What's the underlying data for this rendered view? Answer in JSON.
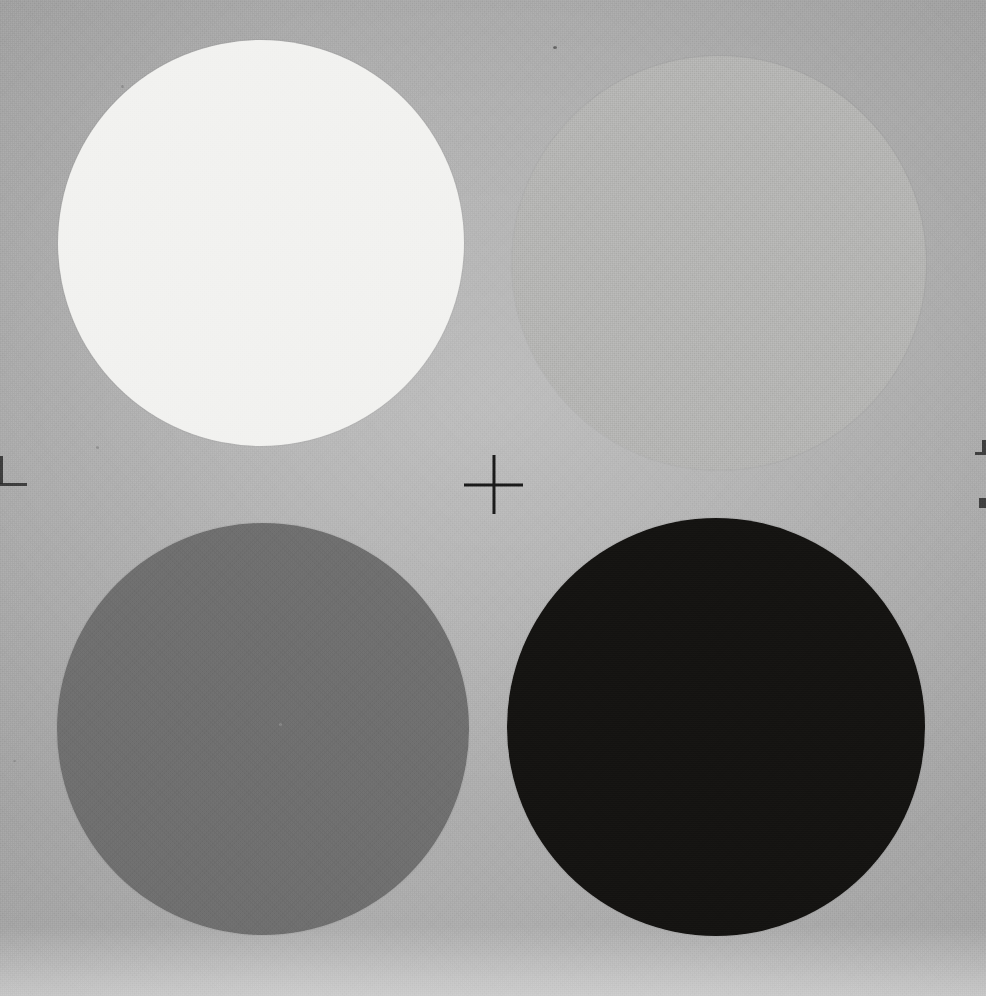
{
  "document": {
    "title": "Grayscale Calibration Target",
    "kind": "scanned-reflectance-target",
    "width_px": 986,
    "height_px": 996
  },
  "background": {
    "label": "paper substrate",
    "color": "#c9c9c9",
    "bottom_edge_color": "#fbfbfb"
  },
  "registration_mark": {
    "label": "center registration crosshair",
    "color": "#1a1a1a",
    "center_x": 493,
    "center_y": 484,
    "arm_length_px": 29,
    "stroke_px": 3
  },
  "chart_data": {
    "type": "scatter",
    "title": "Grayscale Calibration Target",
    "subtitle": "Four-step reflectance patch array with center registration mark",
    "xlabel": "",
    "ylabel": "",
    "xlim": [
      0,
      986
    ],
    "ylim": [
      0,
      996
    ],
    "grid": false,
    "legend": "none",
    "categories": [
      "White",
      "Light Gray",
      "Mid Gray",
      "Black"
    ],
    "values": [
      94,
      72,
      42,
      8
    ],
    "value_unit": "% reflectance",
    "series": [
      {
        "name": "Reflectance patches",
        "points": [
          {
            "id": "patch-white",
            "label": "White",
            "position": "top-left",
            "color": "#f2f2f0",
            "reflectance_percent": 94,
            "cx": 261,
            "cy": 243,
            "r": 203
          },
          {
            "id": "patch-light-gray",
            "label": "Light Gray",
            "position": "top-right",
            "color": "#b4b4b2",
            "reflectance_percent": 72,
            "cx": 719,
            "cy": 263,
            "r": 207
          },
          {
            "id": "patch-mid-gray",
            "label": "Mid Gray",
            "position": "bottom-left",
            "color": "#6e6e6e",
            "reflectance_percent": 42,
            "cx": 263,
            "cy": 729,
            "r": 206
          },
          {
            "id": "patch-black",
            "label": "Black",
            "position": "bottom-right",
            "color": "#141311",
            "reflectance_percent": 8,
            "cx": 716,
            "cy": 727,
            "r": 209
          }
        ]
      }
    ],
    "annotations": [
      {
        "id": "registration-crosshair",
        "text": "+",
        "x": 493,
        "y": 484,
        "color": "#1a1a1a"
      }
    ]
  }
}
